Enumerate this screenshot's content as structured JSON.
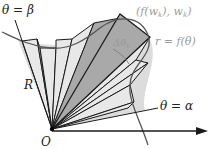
{
  "diagram": {
    "labels": {
      "theta_beta": "θ = β",
      "theta_alpha": "θ = α",
      "point": "(f(w_k), w_k)",
      "point_f": "(f(w",
      "point_k1": "k",
      "point_mid": "), w",
      "point_k2": "k",
      "point_end": ")",
      "curve": "r = f(θ)",
      "delta": "Δθ",
      "delta_sub": "k",
      "region": "R",
      "origin": "O"
    },
    "colors": {
      "sector_fill": "#e6e6e6",
      "highlight_fill": "#a9a9a9",
      "region_fill": "#c8c8c8",
      "line": "#1a1a1a",
      "curve": "#555555",
      "label_gray": "#9a9a9a"
    }
  }
}
